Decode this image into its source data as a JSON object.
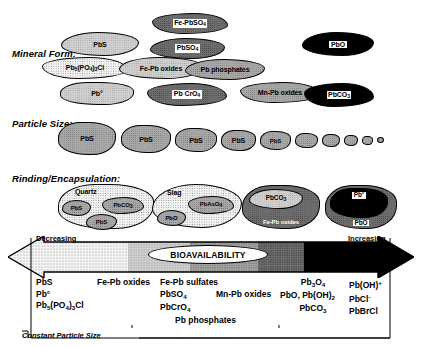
{
  "figure": {
    "type": "conceptual-diagram"
  },
  "rows": [
    {
      "label": "Mineral Form:"
    },
    {
      "label": "Particle Size:"
    },
    {
      "label": "Rinding/Encapsulation:"
    }
  ],
  "mineral_form": {
    "blobs": [
      {
        "name": "pbs",
        "label": "PbS",
        "shade": "light"
      },
      {
        "name": "pb5po43cl",
        "label": "Pb5(PO4)3Cl",
        "shade": "dotted"
      },
      {
        "name": "pb-metal",
        "label": "Pb°",
        "shade": "light"
      },
      {
        "name": "fe-pb-oxides",
        "label": "Fe-Pb oxides",
        "shade": "light"
      },
      {
        "name": "fe-pbso4",
        "label": "Fe-PbSO4",
        "shade": "dark"
      },
      {
        "name": "pbso4",
        "label": "PbSO4",
        "shade": "dark"
      },
      {
        "name": "pb-cro4",
        "label": "Pb CrO4",
        "shade": "dark"
      },
      {
        "name": "pb-phosphates",
        "label": "Pb phosphates",
        "shade": "medium"
      },
      {
        "name": "mn-pb-oxides",
        "label": "Mn-Pb oxides",
        "shade": "medium"
      },
      {
        "name": "pbo",
        "label": "PbO",
        "shade": "black"
      },
      {
        "name": "pbco3",
        "label": "PbCO3",
        "shade": "black"
      }
    ]
  },
  "particle_size": {
    "label_text": "PbS",
    "count": 10,
    "note": "PbS grains shown at progressively decreasing size"
  },
  "rinding": {
    "groups": [
      {
        "name": "quartz-group",
        "host": "Quartz",
        "host_shade": "dotted",
        "inclusions": [
          {
            "label": "PbS",
            "shade": "medium"
          },
          {
            "label": "PbCO3",
            "shade": "medium"
          },
          {
            "label": "PbS",
            "shade": "medium"
          }
        ]
      },
      {
        "name": "slag-group",
        "host": "Slag",
        "host_shade": "dotted",
        "inclusions": [
          {
            "label": "PbAsO4",
            "shade": "medium"
          },
          {
            "label": "PbO",
            "shade": "medium"
          }
        ]
      },
      {
        "name": "fe-pb-oxide-rind-group",
        "host": "Fe-Pb oxides",
        "host_shade": "dark",
        "inclusions": [
          {
            "label": "PbCO3",
            "shade": "light"
          }
        ]
      },
      {
        "name": "pbo-rind-group",
        "host": "PbO",
        "host_shade": "dark",
        "inclusions": [
          {
            "label": "Pb°",
            "shade": "black"
          }
        ]
      }
    ]
  },
  "arrow": {
    "left_label": "Decreasing",
    "right_label": "Increasing",
    "center_label": "BIOAVAILABILITY",
    "direction": "bidirectional",
    "gradient_stops": [
      "dotted-light",
      "light",
      "medium",
      "dark",
      "black"
    ]
  },
  "table": {
    "columns": [
      {
        "name": "col-least-bioavailable",
        "items": [
          "PbS",
          "Pb°",
          "Pb5(PO4)3Cl"
        ]
      },
      {
        "name": "col-fe-pb-oxides",
        "items": [
          "Fe-Pb oxides"
        ]
      },
      {
        "name": "col-fe-pb-sulfates",
        "items": [
          "Fe-Pb sulfates",
          "PbSO4",
          "PbCrO4",
          "PbAsO4"
        ]
      },
      {
        "name": "col-mn-pb-oxides",
        "items": [
          "Mn-Pb oxides"
        ]
      },
      {
        "name": "col-pb-oxides-carbonate",
        "items": [
          "Pb3O4",
          "PbO, Pb(OH)2",
          "PbCO3"
        ]
      },
      {
        "name": "col-most-bioavailable",
        "items": [
          "Pb(OH)+",
          "PbCl-",
          "PbBrCl"
        ]
      }
    ],
    "span_bracket": "Pb phosphates",
    "footnote": "Constant Particle Size"
  },
  "colors": {
    "outline": "#000000",
    "black_fill": "#000000",
    "dark_fill": "#6e6e6e",
    "medium_fill": "#a8a8a8",
    "light_fill": "#cfcfcf",
    "dotted_fill": "#f2f2f2",
    "background": "#ffffff"
  }
}
